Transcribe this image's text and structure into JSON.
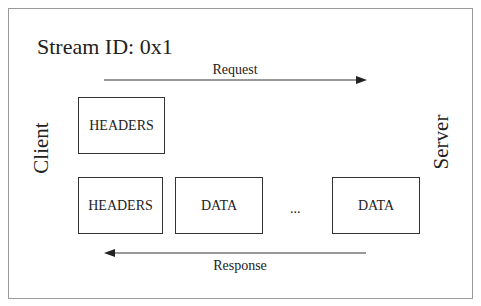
{
  "title": "Stream ID: 0x1",
  "participants": {
    "left": "Client",
    "right": "Server"
  },
  "request": {
    "label": "Request",
    "direction": "client-to-server",
    "frames": [
      {
        "label": "HEADERS"
      }
    ]
  },
  "response": {
    "label": "Response",
    "direction": "server-to-client",
    "frames": [
      {
        "label": "HEADERS"
      },
      {
        "label": "DATA"
      },
      {
        "label": "DATA"
      }
    ],
    "ellipsis": "..."
  },
  "colors": {
    "border": "#9a9a9a",
    "box_border": "#333333",
    "text": "#222222",
    "arrow": "#333333"
  }
}
